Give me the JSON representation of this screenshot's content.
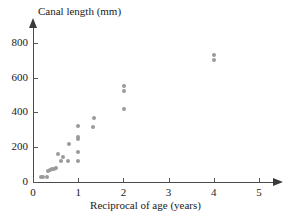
{
  "chart_data": {
    "type": "scatter",
    "title": "",
    "xlabel": "Reciprocal of age (years)",
    "ylabel": "Canal length (mm)",
    "xlim": [
      0,
      5.4
    ],
    "ylim": [
      0,
      880
    ],
    "xticks": [
      0,
      1,
      2,
      3,
      4,
      5
    ],
    "xtick_labels": [
      "0",
      "1",
      "2",
      "3",
      "4",
      "5"
    ],
    "yticks": [
      0,
      200,
      400,
      600,
      800
    ],
    "ytick_labels": [
      "0",
      "200",
      "400",
      "600",
      "800"
    ],
    "grid": false,
    "legend": false,
    "marker_color": "#9a9a9a",
    "axis_color": "#4a4a4a",
    "points": [
      {
        "x": 0.18,
        "y": 30
      },
      {
        "x": 0.22,
        "y": 30
      },
      {
        "x": 0.3,
        "y": 30
      },
      {
        "x": 0.33,
        "y": 65
      },
      {
        "x": 0.38,
        "y": 70
      },
      {
        "x": 0.42,
        "y": 72
      },
      {
        "x": 0.46,
        "y": 75
      },
      {
        "x": 0.5,
        "y": 78
      },
      {
        "x": 0.55,
        "y": 160
      },
      {
        "x": 0.62,
        "y": 120
      },
      {
        "x": 0.66,
        "y": 145
      },
      {
        "x": 0.78,
        "y": 120
      },
      {
        "x": 0.8,
        "y": 220
      },
      {
        "x": 1.0,
        "y": 120
      },
      {
        "x": 1.0,
        "y": 170
      },
      {
        "x": 1.0,
        "y": 245
      },
      {
        "x": 1.0,
        "y": 258
      },
      {
        "x": 1.0,
        "y": 320
      },
      {
        "x": 1.32,
        "y": 318
      },
      {
        "x": 1.35,
        "y": 370
      },
      {
        "x": 2.02,
        "y": 420
      },
      {
        "x": 2.02,
        "y": 525
      },
      {
        "x": 2.02,
        "y": 550
      },
      {
        "x": 4.0,
        "y": 700
      },
      {
        "x": 4.0,
        "y": 730
      }
    ]
  }
}
